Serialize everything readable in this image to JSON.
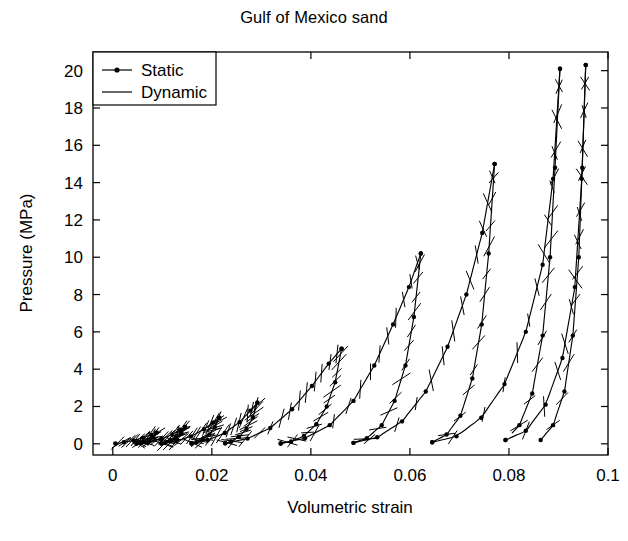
{
  "chart_data": {
    "type": "line",
    "title": "Gulf of Mexico sand",
    "xlabel": "Volumetric strain",
    "ylabel": "Pressure (MPa)",
    "xlim": [
      -0.004,
      0.1
    ],
    "ylim": [
      -0.6,
      21.0
    ],
    "grid": false,
    "legend_position": "upper-left",
    "xticks": [
      0,
      0.02,
      0.04,
      0.06,
      0.08,
      0.1
    ],
    "xticklabels": [
      "0",
      "0.02",
      "0.04",
      "0.06",
      "0.08",
      "0.1"
    ],
    "yticks": [
      0,
      2,
      4,
      6,
      8,
      10,
      12,
      14,
      16,
      18,
      20
    ],
    "yticklabels": [
      "0",
      "2",
      "4",
      "6",
      "8",
      "10",
      "12",
      "14",
      "16",
      "18",
      "20"
    ],
    "legend": [
      {
        "name": "Static",
        "style": "line-with-markers",
        "color": "#000000"
      },
      {
        "name": "Dynamic",
        "style": "line",
        "color": "#000000"
      }
    ],
    "series": [
      {
        "name": "Static",
        "marker": "dot",
        "color": "#000000",
        "cycles": [
          {
            "peak_pressure": 0.6,
            "load": [
              [
                0.0005,
                0.02
              ],
              [
                0.0022,
                0.08
              ],
              [
                0.0042,
                0.18
              ],
              [
                0.0061,
                0.32
              ],
              [
                0.0077,
                0.48
              ],
              [
                0.0088,
                0.6
              ]
            ],
            "unload": [
              [
                0.0088,
                0.6
              ],
              [
                0.0082,
                0.36
              ],
              [
                0.0074,
                0.2
              ],
              [
                0.0065,
                0.1
              ],
              [
                0.0056,
                0.04
              ],
              [
                0.0048,
                0.01
              ]
            ]
          },
          {
            "peak_pressure": 0.9,
            "load": [
              [
                0.0048,
                0.01
              ],
              [
                0.0072,
                0.1
              ],
              [
                0.0098,
                0.26
              ],
              [
                0.012,
                0.5
              ],
              [
                0.0136,
                0.75
              ],
              [
                0.0146,
                0.9
              ]
            ],
            "unload": [
              [
                0.0146,
                0.9
              ],
              [
                0.0138,
                0.56
              ],
              [
                0.0128,
                0.3
              ],
              [
                0.0117,
                0.14
              ],
              [
                0.0106,
                0.05
              ],
              [
                0.0098,
                0.01
              ]
            ]
          },
          {
            "peak_pressure": 1.4,
            "load": [
              [
                0.0098,
                0.01
              ],
              [
                0.0128,
                0.14
              ],
              [
                0.0158,
                0.4
              ],
              [
                0.0184,
                0.78
              ],
              [
                0.0203,
                1.15
              ],
              [
                0.0215,
                1.4
              ]
            ],
            "unload": [
              [
                0.0215,
                1.4
              ],
              [
                0.0206,
                0.9
              ],
              [
                0.0195,
                0.5
              ],
              [
                0.0182,
                0.24
              ],
              [
                0.0169,
                0.08
              ],
              [
                0.0159,
                0.02
              ]
            ]
          },
          {
            "peak_pressure": 2.2,
            "load": [
              [
                0.0159,
                0.02
              ],
              [
                0.0192,
                0.2
              ],
              [
                0.0226,
                0.58
              ],
              [
                0.0256,
                1.16
              ],
              [
                0.0278,
                1.78
              ],
              [
                0.0292,
                2.2
              ]
            ],
            "unload": [
              [
                0.0292,
                2.2
              ],
              [
                0.0283,
                1.42
              ],
              [
                0.027,
                0.8
              ],
              [
                0.0255,
                0.38
              ],
              [
                0.0239,
                0.13
              ],
              [
                0.0227,
                0.03
              ]
            ]
          },
          {
            "peak_pressure": 5.1,
            "load": [
              [
                0.0227,
                0.03
              ],
              [
                0.0272,
                0.28
              ],
              [
                0.0318,
                0.85
              ],
              [
                0.0362,
                1.85
              ],
              [
                0.0402,
                3.1
              ],
              [
                0.0436,
                4.3
              ],
              [
                0.0462,
                5.1
              ]
            ],
            "unload": [
              [
                0.0462,
                5.1
              ],
              [
                0.0449,
                3.3
              ],
              [
                0.0432,
                2.0
              ],
              [
                0.0411,
                1.05
              ],
              [
                0.0386,
                0.42
              ],
              [
                0.036,
                0.12
              ],
              [
                0.0339,
                0.02
              ]
            ]
          },
          {
            "peak_pressure": 10.2,
            "load": [
              [
                0.0339,
                0.02
              ],
              [
                0.0388,
                0.3
              ],
              [
                0.0438,
                1.0
              ],
              [
                0.0486,
                2.3
              ],
              [
                0.0528,
                4.2
              ],
              [
                0.0566,
                6.4
              ],
              [
                0.0598,
                8.4
              ],
              [
                0.0622,
                10.2
              ]
            ],
            "unload": [
              [
                0.0622,
                10.2
              ],
              [
                0.0608,
                6.8
              ],
              [
                0.0591,
                4.2
              ],
              [
                0.0569,
                2.3
              ],
              [
                0.0543,
                1.0
              ],
              [
                0.0513,
                0.3
              ],
              [
                0.0486,
                0.05
              ]
            ]
          },
          {
            "peak_pressure": 15.0,
            "load": [
              [
                0.0486,
                0.05
              ],
              [
                0.0534,
                0.35
              ],
              [
                0.0584,
                1.2
              ],
              [
                0.0632,
                2.8
              ],
              [
                0.0676,
                5.2
              ],
              [
                0.0714,
                8.0
              ],
              [
                0.0746,
                11.3
              ],
              [
                0.0771,
                15.0
              ]
            ],
            "unload": [
              [
                0.0771,
                15.0
              ],
              [
                0.0759,
                10.2
              ],
              [
                0.0745,
                6.4
              ],
              [
                0.0726,
                3.5
              ],
              [
                0.0702,
                1.5
              ],
              [
                0.0674,
                0.5
              ],
              [
                0.0645,
                0.08
              ]
            ]
          },
          {
            "peak_pressure": 20.1,
            "load": [
              [
                0.0645,
                0.08
              ],
              [
                0.0694,
                0.4
              ],
              [
                0.0744,
                1.4
              ],
              [
                0.0791,
                3.2
              ],
              [
                0.0834,
                6.0
              ],
              [
                0.0868,
                9.6
              ],
              [
                0.0889,
                14.2
              ],
              [
                0.0903,
                20.1
              ]
            ],
            "unload": [
              [
                0.0903,
                20.1
              ],
              [
                0.0893,
                14.8
              ],
              [
                0.0883,
                10.0
              ],
              [
                0.0868,
                5.8
              ],
              [
                0.0847,
                2.7
              ],
              [
                0.0821,
                1.0
              ],
              [
                0.0793,
                0.2
              ]
            ]
          },
          {
            "peak_pressure": 20.3,
            "load": [
              [
                0.0793,
                0.2
              ],
              [
                0.0834,
                0.7
              ],
              [
                0.0874,
                2.1
              ],
              [
                0.0908,
                4.6
              ],
              [
                0.0933,
                8.4
              ],
              [
                0.0947,
                14.2
              ],
              [
                0.0955,
                20.3
              ]
            ],
            "unload": [
              [
                0.0955,
                20.3
              ],
              [
                0.0948,
                14.8
              ],
              [
                0.0941,
                10.0
              ],
              [
                0.0929,
                5.8
              ],
              [
                0.0912,
                2.8
              ],
              [
                0.0889,
                1.0
              ],
              [
                0.0864,
                0.2
              ]
            ]
          }
        ]
      },
      {
        "name": "Dynamic",
        "marker": "none",
        "color": "#000000",
        "note": "Short steep line segments overlaying each static loop, representing dynamic (fast) loading paths; each appears as a narrow sloped tick crossing the static curve."
      }
    ]
  },
  "figure": {
    "title": "Gulf of Mexico sand",
    "background": "#ffffff",
    "foreground": "#000000"
  }
}
